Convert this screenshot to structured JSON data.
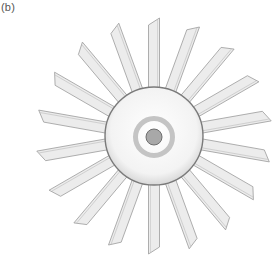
{
  "figure": {
    "panel_label": "(b)",
    "geometry": {
      "center": [
        154,
        136
      ],
      "hub_radius": 49,
      "ring_outer_radius": 21,
      "ring_inner_radius": 16,
      "dot_radius": 8,
      "blade_count": 18,
      "blade_inner_radius": 40,
      "blade_outer_radius": 118,
      "blade_width": 11,
      "blade_start_angle_deg": -90
    },
    "colors": {
      "background": "#ffffff",
      "blade_fill": "#ececec",
      "blade_fill_light": "#f7f7f7",
      "blade_stroke": "#9a9a9a",
      "hub_fill": "#f4f4f4",
      "hub_stroke": "#7a7a7a",
      "ring": "#c4c4c4",
      "dot_fill": "#a8a8a8",
      "dot_stroke": "#6e6e6e"
    }
  }
}
